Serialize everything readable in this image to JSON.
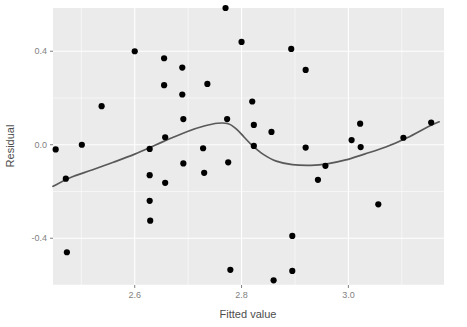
{
  "chart_data": {
    "type": "scatter",
    "title": "",
    "subtitle": "",
    "xlabel": "Fitted value",
    "ylabel": "Residual",
    "xlim": [
      2.447,
      3.179
    ],
    "ylim": [
      -0.6,
      0.585
    ],
    "x_ticks": [
      2.6,
      2.8,
      3.0
    ],
    "x_tick_labels": [
      "2.6",
      "2.8",
      "3.0"
    ],
    "y_ticks": [
      0.4,
      0.0,
      -0.4
    ],
    "y_tick_labels": [
      "0.4",
      "0.0",
      "-0.4"
    ],
    "x_minor_ticks": [
      2.5,
      2.7,
      2.9,
      3.1
    ],
    "y_minor_ticks": [
      0.6,
      0.2,
      -0.2,
      -0.6
    ],
    "grid": true,
    "legend": null,
    "legend_position": "none",
    "panel_background": "#ebebeb",
    "grid_color": "#ffffff",
    "point_color": "#000000",
    "smooth_line_color": "#595959",
    "point_size": 3.1,
    "series": [
      {
        "name": "residuals",
        "type": "scatter",
        "points": [
          [
            2.452,
            -0.02
          ],
          [
            2.471,
            -0.145
          ],
          [
            2.473,
            -0.46
          ],
          [
            2.501,
            0.0
          ],
          [
            2.538,
            0.165
          ],
          [
            2.6,
            0.4
          ],
          [
            2.628,
            -0.018
          ],
          [
            2.628,
            -0.13
          ],
          [
            2.628,
            -0.24
          ],
          [
            2.629,
            -0.325
          ],
          [
            2.655,
            0.37
          ],
          [
            2.655,
            0.255
          ],
          [
            2.657,
            0.032
          ],
          [
            2.657,
            -0.163
          ],
          [
            2.689,
            0.33
          ],
          [
            2.689,
            0.215
          ],
          [
            2.691,
            0.11
          ],
          [
            2.691,
            -0.08
          ],
          [
            2.728,
            -0.015
          ],
          [
            2.73,
            -0.12
          ],
          [
            2.736,
            0.26
          ],
          [
            2.77,
            0.585
          ],
          [
            2.773,
            0.11
          ],
          [
            2.775,
            -0.075
          ],
          [
            2.779,
            -0.535
          ],
          [
            2.8,
            0.44
          ],
          [
            2.82,
            0.185
          ],
          [
            2.823,
            0.085
          ],
          [
            2.823,
            -0.005
          ],
          [
            2.856,
            0.055
          ],
          [
            2.86,
            -0.58
          ],
          [
            2.893,
            0.41
          ],
          [
            2.895,
            -0.39
          ],
          [
            2.895,
            -0.54
          ],
          [
            2.92,
            0.32
          ],
          [
            2.92,
            -0.012
          ],
          [
            2.943,
            -0.15
          ],
          [
            2.957,
            -0.09
          ],
          [
            3.006,
            0.02
          ],
          [
            3.022,
            0.09
          ],
          [
            3.023,
            -0.01
          ],
          [
            3.056,
            -0.255
          ],
          [
            3.103,
            0.03
          ],
          [
            3.155,
            0.095
          ]
        ]
      },
      {
        "name": "loess-smooth",
        "type": "line",
        "points": [
          [
            2.447,
            -0.178
          ],
          [
            2.48,
            -0.14
          ],
          [
            2.52,
            -0.108
          ],
          [
            2.56,
            -0.075
          ],
          [
            2.6,
            -0.04
          ],
          [
            2.64,
            0.0
          ],
          [
            2.67,
            0.03
          ],
          [
            2.7,
            0.058
          ],
          [
            2.73,
            0.08
          ],
          [
            2.755,
            0.092
          ],
          [
            2.775,
            0.09
          ],
          [
            2.79,
            0.068
          ],
          [
            2.805,
            0.032
          ],
          [
            2.82,
            -0.003
          ],
          [
            2.84,
            -0.04
          ],
          [
            2.865,
            -0.07
          ],
          [
            2.895,
            -0.085
          ],
          [
            2.93,
            -0.088
          ],
          [
            2.96,
            -0.082
          ],
          [
            2.995,
            -0.065
          ],
          [
            3.03,
            -0.04
          ],
          [
            3.07,
            -0.01
          ],
          [
            3.11,
            0.03
          ],
          [
            3.15,
            0.078
          ],
          [
            3.17,
            0.098
          ]
        ]
      }
    ]
  },
  "axes": {
    "x_title": "Fitted value",
    "y_title": "Residual"
  }
}
